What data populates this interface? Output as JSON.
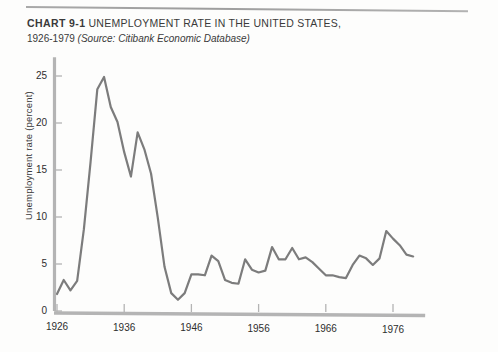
{
  "figure": {
    "chart_label": "CHART 9-1",
    "title": "UNEMPLOYMENT RATE IN THE UNITED STATES,",
    "subtitle_range": "1926-1979",
    "subtitle_source": "(Source: Citibank Economic Database)"
  },
  "colors": {
    "line": "#7c7c7c",
    "axis": "#b4b4b4",
    "text": "#2e2e2e",
    "background": "#fdfdfc",
    "rule": "#949494"
  },
  "chart_data": {
    "type": "line",
    "title": "UNEMPLOYMENT RATE IN THE UNITED STATES,",
    "subtitle": "1926-1979 (Source: Citibank Economic Database)",
    "xlabel": "",
    "ylabel": "Unemployment rate (percent)",
    "xlim": [
      1926,
      1979
    ],
    "ylim": [
      0,
      27
    ],
    "xticks": [
      1926,
      1936,
      1946,
      1956,
      1966,
      1976
    ],
    "yticks": [
      0,
      5,
      10,
      15,
      20,
      25
    ],
    "grid": false,
    "legend": null,
    "series": [
      {
        "name": "Unemployment rate",
        "x": [
          1926,
          1927,
          1928,
          1929,
          1930,
          1931,
          1932,
          1933,
          1934,
          1935,
          1936,
          1937,
          1938,
          1939,
          1940,
          1941,
          1942,
          1943,
          1944,
          1945,
          1946,
          1947,
          1948,
          1949,
          1950,
          1951,
          1952,
          1953,
          1954,
          1955,
          1956,
          1957,
          1958,
          1959,
          1960,
          1961,
          1962,
          1963,
          1964,
          1965,
          1966,
          1967,
          1968,
          1969,
          1970,
          1971,
          1972,
          1973,
          1974,
          1975,
          1976,
          1977,
          1978,
          1979
        ],
        "values": [
          1.8,
          3.3,
          2.2,
          3.2,
          8.7,
          15.9,
          23.6,
          24.9,
          21.7,
          20.1,
          16.9,
          14.3,
          19.0,
          17.2,
          14.6,
          9.9,
          4.7,
          1.9,
          1.2,
          1.9,
          3.9,
          3.9,
          3.8,
          5.9,
          5.3,
          3.3,
          3.0,
          2.9,
          5.5,
          4.4,
          4.1,
          4.3,
          6.8,
          5.5,
          5.5,
          6.7,
          5.5,
          5.7,
          5.2,
          4.5,
          3.8,
          3.8,
          3.6,
          3.5,
          4.9,
          5.9,
          5.6,
          4.9,
          5.6,
          8.5,
          7.7,
          7.0,
          6.0,
          5.8
        ]
      }
    ]
  }
}
